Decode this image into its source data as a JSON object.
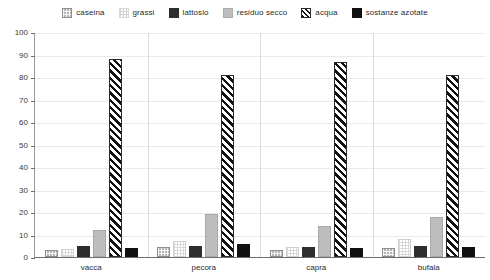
{
  "chart_data": {
    "type": "bar",
    "title": "",
    "subtitle": "",
    "xlabel": "",
    "ylabel": "",
    "categories": [
      "vacca",
      "pecora",
      "capra",
      "bufala"
    ],
    "ylim": [
      0,
      100
    ],
    "yticks": [
      0,
      10,
      20,
      30,
      40,
      50,
      60,
      70,
      80,
      90,
      100
    ],
    "ytick_labels": [
      "0",
      "10",
      "20",
      "30",
      "40",
      "50",
      "60",
      "70",
      "80",
      "90",
      "100"
    ],
    "grid": true,
    "legend_position": "top",
    "series": [
      {
        "name": "caseina",
        "swatch_class": "sw-caseina",
        "fill_class": "fill-caseina",
        "color": "#b4b4b4",
        "values": [
          3.0,
          4.5,
          3.0,
          4.0
        ]
      },
      {
        "name": "grassi",
        "swatch_class": "sw-grassi",
        "fill_class": "fill-grassi",
        "color": "#ffffff",
        "values": [
          3.5,
          7.0,
          4.5,
          8.0
        ]
      },
      {
        "name": "lattosio",
        "swatch_class": "sw-lattosio",
        "fill_class": "fill-lattosio",
        "color": "#2e2e2e",
        "values": [
          5.0,
          5.0,
          4.5,
          5.0
        ]
      },
      {
        "name": "residuo secco",
        "swatch_class": "sw-residuo",
        "fill_class": "fill-residuo",
        "color": "#bdbdbd",
        "values": [
          12.0,
          19.0,
          14.0,
          18.0
        ]
      },
      {
        "name": "acqua",
        "swatch_class": "sw-acqua",
        "fill_class": "fill-acqua",
        "color": "#111111",
        "values": [
          88.0,
          81.0,
          86.5,
          81.0
        ]
      },
      {
        "name": "sostanze azotate",
        "swatch_class": "sw-azotate",
        "fill_class": "fill-azotate",
        "color": "#111111",
        "values": [
          4.0,
          6.0,
          4.0,
          4.5
        ]
      }
    ]
  }
}
